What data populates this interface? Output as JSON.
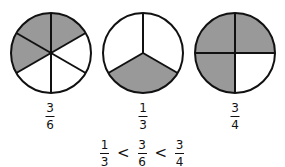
{
  "circles": [
    {
      "label_num": "3",
      "label_den": "6",
      "parts": 6,
      "shaded": 3
    },
    {
      "label_num": "1",
      "label_den": "3",
      "parts": 3,
      "shaded": 1
    },
    {
      "label_num": "3",
      "label_den": "4",
      "parts": 4,
      "shaded": 3
    }
  ],
  "inequality": {
    "terms": [
      {
        "num": "1",
        "den": "3"
      },
      {
        "num": "3",
        "den": "6"
      },
      {
        "num": "3",
        "den": "4"
      }
    ],
    "operator": "<"
  },
  "colors": {
    "shade": "#999999",
    "stroke": "#111111",
    "fill": "#ffffff"
  }
}
